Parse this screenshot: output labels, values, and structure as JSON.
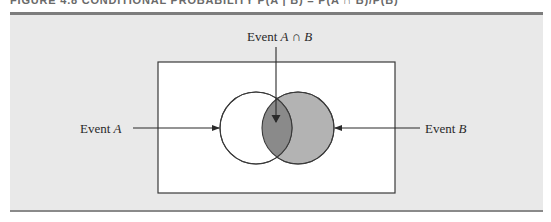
{
  "figure": {
    "caption": "FIGURE 4.8   CONDITIONAL PROBABILITY P(A | B) = P(A ∩ B)/P(B)"
  },
  "diagram": {
    "type": "venn",
    "sample_space": "rectangle",
    "labels": {
      "intersection_prefix": "Event",
      "intersection_var": "A ∩ B",
      "event_a_prefix": "Event",
      "event_a_var": "A",
      "event_b_prefix": "Event",
      "event_b_var": "B"
    },
    "sets": [
      {
        "name": "A",
        "fill": "#ffffff",
        "shaded": false
      },
      {
        "name": "B",
        "fill": "#b3b3b3",
        "shaded": true
      }
    ],
    "intersection": {
      "name": "A ∩ B",
      "fill": "#8a8a8a"
    }
  },
  "colors": {
    "panel_background": "#e9e9e9",
    "rule": "#7d7d7d",
    "stroke": "#3a3a3a",
    "set_b_fill": "#b3b3b3",
    "intersection_fill": "#8a8a8a"
  }
}
